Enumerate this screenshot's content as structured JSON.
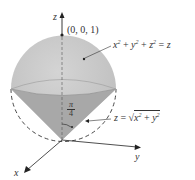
{
  "figure": {
    "axes": {
      "x": "x",
      "y": "y",
      "z": "z"
    },
    "point_label": "(0, 0, 1)",
    "sphere_equation": {
      "lhs_x": "x",
      "lhs_y": "y",
      "lhs_z": "z",
      "exp": "2",
      "plus": "+",
      "eq": "=",
      "rhs": "z"
    },
    "cone_equation": {
      "lhs": "z",
      "eq": "=",
      "sqrt": "√",
      "x": "x",
      "y": "y",
      "exp": "2",
      "plus": "+"
    },
    "angle_label": {
      "numerator": "π",
      "denominator": "4"
    },
    "colors": {
      "sphere_fill": "#c8c8c8",
      "cone_fill": "#a9a9a9",
      "axis": "#333333"
    }
  }
}
